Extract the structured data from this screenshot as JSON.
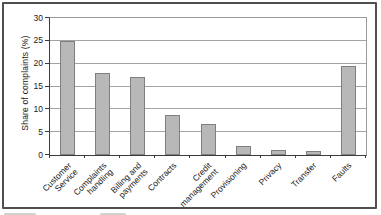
{
  "chart_data": {
    "type": "bar",
    "title": "",
    "xlabel": "",
    "ylabel": "Share of complaints (%)",
    "ylim": [
      0,
      30
    ],
    "yticks": [
      0,
      5,
      10,
      15,
      20,
      25,
      30
    ],
    "grid": true,
    "legend_position": "none",
    "categories": [
      "Customer Service",
      "Complaints handling",
      "Billing and payments",
      "Contracts",
      "Credit management",
      "Provisioning",
      "Privacy",
      "Transfer",
      "Faults"
    ],
    "category_label_lines": [
      [
        "Customer",
        "Service"
      ],
      [
        "Complaints",
        "handling"
      ],
      [
        "Billing and",
        "payments"
      ],
      [
        "Contracts"
      ],
      [
        "Credit",
        "management"
      ],
      [
        "Provisioning"
      ],
      [
        "Privacy"
      ],
      [
        "Transfer"
      ],
      [
        "Faults"
      ]
    ],
    "values": [
      25,
      18,
      17,
      8.8,
      6.8,
      2,
      1.1,
      0.9,
      19.5
    ],
    "bar_color": "#b8b8b8",
    "bar_border_color": "#7f7f7f",
    "axis_color": "#3c3c3c",
    "grid_color": "#a3a3a3"
  }
}
